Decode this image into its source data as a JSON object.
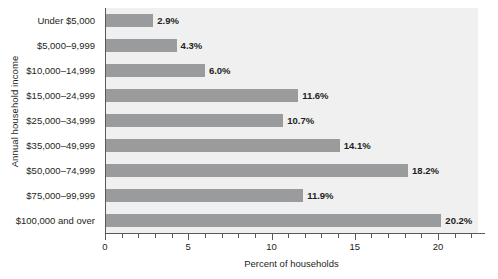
{
  "chart_data": {
    "type": "bar",
    "orientation": "horizontal",
    "title": "",
    "xlabel": "Percent of households",
    "ylabel": "Annual household income",
    "categories": [
      "Under $5,000",
      "$5,000–9,999",
      "$10,000–14,999",
      "$15,000–24,999",
      "$25,000–34,999",
      "$35,000–49,999",
      "$50,000–74,999",
      "$75,000–99,999",
      "$100,000 and over"
    ],
    "values": [
      2.9,
      4.3,
      6.0,
      11.6,
      10.7,
      14.1,
      18.2,
      11.9,
      20.2
    ],
    "value_labels": [
      "2.9%",
      "4.3%",
      "6.0%",
      "11.6%",
      "10.7%",
      "14.1%",
      "18.2%",
      "11.9%",
      "20.2%"
    ],
    "xlim": [
      0,
      22.4
    ],
    "xticks": [
      0,
      5,
      10,
      15,
      20
    ],
    "xtick_labels": [
      "0",
      "5",
      "10",
      "15",
      "20"
    ],
    "minor_tick_step": 1,
    "grid": false,
    "legend": null,
    "colors": {
      "bar": "#9a9b9d",
      "plot_background": "#f0f0f1",
      "figure_background": "#ffffff",
      "axis": "#58595b",
      "text": "#231f20"
    }
  }
}
